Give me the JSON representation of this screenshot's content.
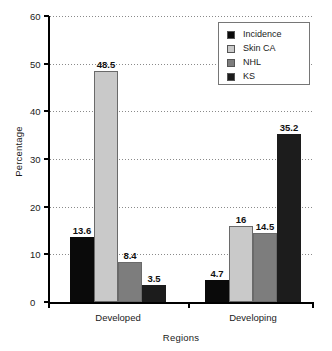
{
  "chart_data": {
    "type": "bar",
    "title": "",
    "xlabel": "Regions",
    "ylabel": "Percentage",
    "categories": [
      "Developed",
      "Developing"
    ],
    "ylim": [
      0,
      60
    ],
    "yticks": [
      0,
      10,
      20,
      30,
      40,
      50,
      60
    ],
    "ytick_labels": [
      "0",
      "10",
      "20",
      "30",
      "40",
      "50",
      "60"
    ],
    "grid": true,
    "legend_position": "top-right",
    "series": [
      {
        "name": "Incidence",
        "color": "#0a0a0a",
        "values": [
          13.6,
          4.7
        ],
        "labels": [
          "13.6",
          "4.7"
        ]
      },
      {
        "name": "Skin CA",
        "color": "#c9c9c9",
        "values": [
          48.5,
          16
        ],
        "labels": [
          "48.5",
          "16"
        ]
      },
      {
        "name": "NHL",
        "color": "#7d7d7d",
        "values": [
          8.4,
          14.5
        ],
        "labels": [
          "8.4",
          "14.5"
        ]
      },
      {
        "name": "KS",
        "color": "#1c1c1c",
        "values": [
          3.5,
          35.2
        ],
        "labels": [
          "3.5",
          "35.2"
        ]
      }
    ]
  },
  "axis": {
    "y_label": "Percentage",
    "x_label": "Regions",
    "ticks": {
      "t0": "0",
      "t10": "10",
      "t20": "20",
      "t30": "30",
      "t40": "40",
      "t50": "50",
      "t60": "60"
    }
  },
  "groups": {
    "g0": "Developed",
    "g1": "Developing"
  },
  "legend": {
    "items": [
      {
        "label": "Incidence",
        "color": "#0a0a0a"
      },
      {
        "label": "Skin CA",
        "color": "#c9c9c9"
      },
      {
        "label": "NHL",
        "color": "#7d7d7d"
      },
      {
        "label": "KS",
        "color": "#1c1c1c"
      }
    ]
  },
  "bar_labels": {
    "developed": {
      "incidence": "13.6",
      "skin_ca": "48.5",
      "nhl": "8.4",
      "ks": "3.5"
    },
    "developing": {
      "incidence": "4.7",
      "skin_ca": "16",
      "nhl": "14.5",
      "ks": "35.2"
    }
  }
}
